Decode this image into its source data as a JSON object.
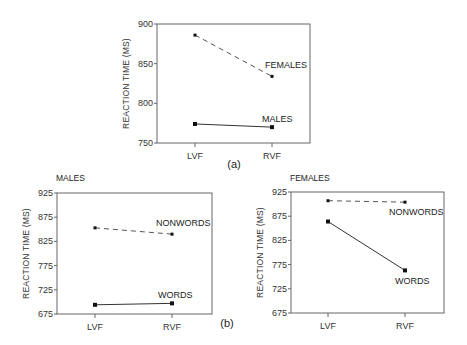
{
  "figure": {
    "caption_a": "(a)",
    "caption_b": "(b)"
  },
  "chart_data": [
    {
      "id": "a",
      "type": "line",
      "title": "",
      "xlabel": "",
      "ylabel": "REACTION TIME (MS)",
      "categories": [
        "LVF",
        "RVF"
      ],
      "ylim": [
        750,
        900
      ],
      "yticks": [
        750,
        800,
        850,
        900
      ],
      "grid": false,
      "legend": "inline labels",
      "series": [
        {
          "name": "FEMALES",
          "values": [
            886,
            834
          ],
          "style": "dashed",
          "marker": "square-small"
        },
        {
          "name": "MALES",
          "values": [
            774,
            770
          ],
          "style": "solid",
          "marker": "square"
        }
      ]
    },
    {
      "id": "b-males",
      "type": "line",
      "title": "MALES",
      "xlabel": "",
      "ylabel": "REACTION TIME (MS)",
      "categories": [
        "LVF",
        "RVF"
      ],
      "ylim": [
        675,
        925
      ],
      "yticks": [
        675,
        725,
        775,
        825,
        875,
        925
      ],
      "grid": false,
      "legend": "inline labels",
      "series": [
        {
          "name": "NONWORDS",
          "values": [
            853,
            840
          ],
          "style": "dashed",
          "marker": "square-small"
        },
        {
          "name": "WORDS",
          "values": [
            694,
            697
          ],
          "style": "solid",
          "marker": "square"
        }
      ]
    },
    {
      "id": "b-females",
      "type": "line",
      "title": "FEMALES",
      "xlabel": "",
      "ylabel": "REACTION TIME (MS)",
      "categories": [
        "LVF",
        "RVF"
      ],
      "ylim": [
        675,
        925
      ],
      "yticks": [
        675,
        725,
        775,
        825,
        875,
        925
      ],
      "grid": false,
      "legend": "inline labels",
      "series": [
        {
          "name": "NONWORDS",
          "values": [
            907,
            904
          ],
          "style": "dashed",
          "marker": "square-small"
        },
        {
          "name": "WORDS",
          "values": [
            864,
            763
          ],
          "style": "solid",
          "marker": "square"
        }
      ]
    }
  ],
  "layout": {
    "panels": [
      {
        "x0": 157,
        "x1": 310,
        "y0": 24,
        "y1": 143,
        "xpos": [
          195,
          272
        ],
        "labels": [
          {
            "dx": -7,
            "dy": -8
          },
          {
            "dx": -10,
            "dy": -5
          }
        ],
        "title_pos": null
      },
      {
        "x0": 57,
        "x1": 212,
        "y0": 193,
        "y1": 314,
        "xpos": [
          95,
          172
        ],
        "labels": [
          {
            "dx": -16,
            "dy": -8
          },
          {
            "dx": -14,
            "dy": -5
          }
        ],
        "title_pos": [
          56,
          181
        ]
      },
      {
        "x0": 291,
        "x1": 444,
        "y0": 192,
        "y1": 313,
        "xpos": [
          328,
          405
        ],
        "labels": [
          {
            "dx": -16,
            "dy": 13
          },
          {
            "dx": -10,
            "dy": 14
          }
        ],
        "title_pos": [
          290,
          181
        ]
      }
    ],
    "caption_a_pos": [
      234,
      168
    ],
    "caption_b_pos": [
      227,
      327
    ]
  }
}
